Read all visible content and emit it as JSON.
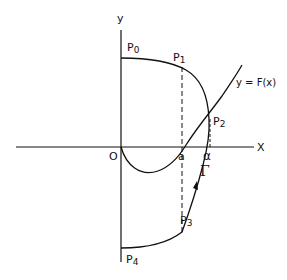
{
  "diagram": {
    "axes": {
      "x_label": "X",
      "y_label": "y",
      "origin_label": "O"
    },
    "curve_label": "y = F(x)",
    "path_label": "Γ",
    "points": [
      {
        "name": "P0",
        "label": "P",
        "sub": "0"
      },
      {
        "name": "P1",
        "label": "P",
        "sub": "1"
      },
      {
        "name": "P2",
        "label": "P",
        "sub": "2"
      },
      {
        "name": "P3",
        "label": "P",
        "sub": "3"
      },
      {
        "name": "P4",
        "label": "P",
        "sub": "4"
      }
    ],
    "x_marks": {
      "a": "a",
      "alpha": "α"
    },
    "colors": {
      "ink": "#111111",
      "background": "#ffffff"
    }
  }
}
